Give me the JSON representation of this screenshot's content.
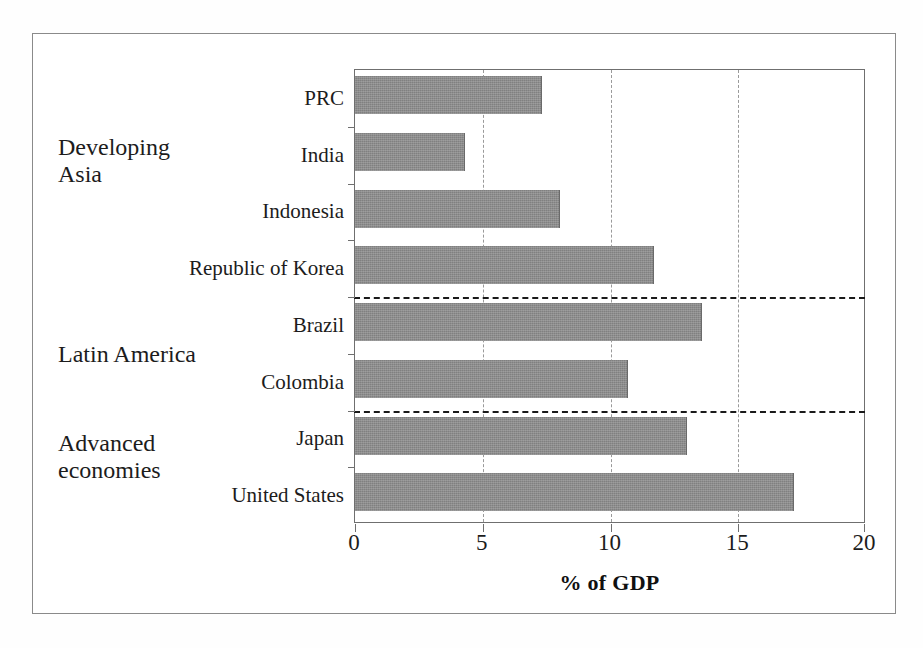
{
  "chart_data": {
    "type": "bar",
    "orientation": "horizontal",
    "title": "",
    "xlabel": "% of GDP",
    "ylabel": "",
    "xlim": [
      0,
      20
    ],
    "xticks": [
      0,
      5,
      10,
      15,
      20
    ],
    "xtick_labels": [
      "0",
      "5",
      "10",
      "15",
      "20"
    ],
    "gridlines": [
      5,
      10,
      15
    ],
    "grid": true,
    "grid_style": "dashed-vertical",
    "legend": "none",
    "categories": [
      "PRC",
      "India",
      "Indonesia",
      "Republic of Korea",
      "Brazil",
      "Colombia",
      "Japan",
      "United States"
    ],
    "values": [
      7.3,
      4.3,
      8.0,
      11.7,
      13.6,
      10.7,
      13.0,
      17.2
    ],
    "bar_color": "#808080",
    "groups": [
      {
        "label": "Developing\nAsia",
        "categories": [
          "PRC",
          "India",
          "Indonesia",
          "Republic of Korea"
        ]
      },
      {
        "label": "Latin America",
        "categories": [
          "Brazil",
          "Colombia"
        ]
      },
      {
        "label": "Advanced\neconomies",
        "categories": [
          "Japan",
          "United States"
        ]
      }
    ],
    "group_separators_after": [
      "Republic of Korea",
      "Colombia"
    ]
  },
  "axis": {
    "x_title": "% of GDP",
    "tick_0": "0",
    "tick_1": "5",
    "tick_2": "10",
    "tick_3": "15",
    "tick_4": "20"
  },
  "categories": {
    "c0": "PRC",
    "c1": "India",
    "c2": "Indonesia",
    "c3": "Republic of Korea",
    "c4": "Brazil",
    "c5": "Colombia",
    "c6": "Japan",
    "c7": "United States"
  },
  "groups": {
    "g0": "Developing\nAsia",
    "g1": "Latin America",
    "g2": "Advanced\neconomies"
  }
}
